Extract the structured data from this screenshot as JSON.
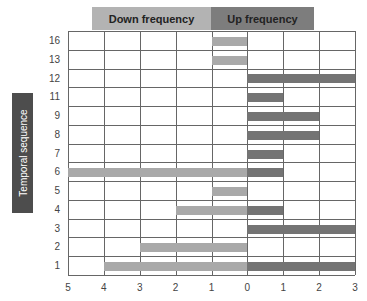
{
  "chart_data": {
    "type": "bar",
    "orientation": "horizontal-diverging",
    "title": "",
    "header_labels": {
      "left": "Down frequency",
      "right": "Up frequency"
    },
    "ylabel": "Temporal sequence",
    "xlabel": "",
    "categories": [
      "16",
      "13",
      "12",
      "11",
      "9",
      "8",
      "7",
      "6",
      "5",
      "4",
      "3",
      "2",
      "1"
    ],
    "series": [
      {
        "name": "Down frequency",
        "color": "#a9a9a9",
        "values": [
          1,
          1,
          0,
          0,
          0,
          0,
          0,
          5,
          1,
          2,
          0,
          3,
          4
        ]
      },
      {
        "name": "Up frequency",
        "color": "#747474",
        "values": [
          0,
          0,
          3,
          1,
          2,
          2,
          1,
          1,
          0,
          1,
          3,
          0,
          3
        ]
      }
    ],
    "x_ticks": [
      "5",
      "4",
      "3",
      "2",
      "1",
      "0",
      "1",
      "2",
      "3"
    ],
    "xlim_down": [
      0,
      5
    ],
    "xlim_up": [
      0,
      3
    ],
    "grid": true,
    "legend": "header boxes above plot"
  },
  "headers": {
    "down": "Down frequency",
    "up": "Up frequency"
  },
  "ylabel": "Temporal sequence"
}
